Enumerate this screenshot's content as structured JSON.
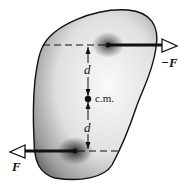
{
  "diagram": {
    "type": "force-couple-on-rigid-body",
    "labels": {
      "upper_force": "−F",
      "lower_force": "F",
      "upper_distance": "d",
      "lower_distance": "d",
      "center_of_mass": "c.m."
    },
    "colors": {
      "outline": "#111111",
      "body_light": "#f2f2f2",
      "body_dark": "#6a6a6a",
      "arrow": "#111111"
    }
  }
}
